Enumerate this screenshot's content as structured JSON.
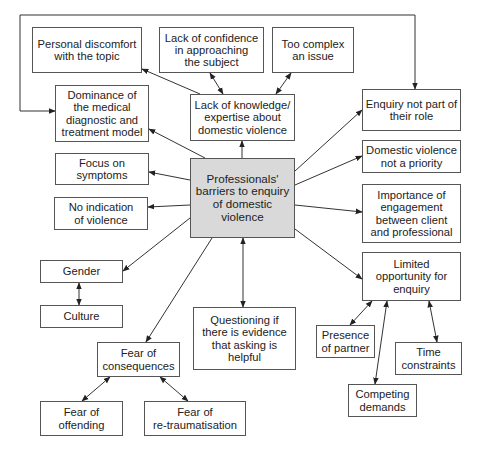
{
  "diagram": {
    "title": "Professionals' barriers to enquiry of domestic violence",
    "colors": {
      "line": "#333333",
      "border": "#555555",
      "central_fill": "#d9d9d9",
      "text": "#222222"
    },
    "nodes": [
      {
        "id": "central",
        "label": "Professionals'\nbarriers to enquiry\nof domestic\nviolence",
        "x": 190,
        "y": 158,
        "w": 105,
        "h": 80,
        "central": true
      },
      {
        "id": "personal_discomfort",
        "label": "Personal discomfort\nwith the topic",
        "x": 32,
        "y": 27,
        "w": 110,
        "h": 46
      },
      {
        "id": "lack_confidence",
        "label": "Lack of confidence\nin approaching\nthe subject",
        "x": 159,
        "y": 27,
        "w": 105,
        "h": 46
      },
      {
        "id": "too_complex",
        "label": "Too complex\nan issue",
        "x": 272,
        "y": 27,
        "w": 82,
        "h": 46
      },
      {
        "id": "dominance",
        "label": "Dominance of\nthe medical\ndiagnostic and\ntreatment model",
        "x": 55,
        "y": 85,
        "w": 94,
        "h": 57
      },
      {
        "id": "lack_knowledge",
        "label": "Lack of knowledge/\nexpertise about\ndomestic violence",
        "x": 190,
        "y": 94,
        "w": 105,
        "h": 47
      },
      {
        "id": "enquiry_not_role",
        "label": "Enquiry not part of\ntheir role",
        "x": 362,
        "y": 89,
        "w": 99,
        "h": 42
      },
      {
        "id": "focus_symptoms",
        "label": "Focus on\nsymptoms",
        "x": 55,
        "y": 153,
        "w": 94,
        "h": 32
      },
      {
        "id": "dv_not_priority",
        "label": "Domestic violence\nnot a priority",
        "x": 362,
        "y": 140,
        "w": 99,
        "h": 33
      },
      {
        "id": "no_indication",
        "label": "No indication\nof violence",
        "x": 54,
        "y": 197,
        "w": 94,
        "h": 33
      },
      {
        "id": "importance_engagement",
        "label": "Importance of\nengagement\nbetween client\nand professional",
        "x": 362,
        "y": 184,
        "w": 99,
        "h": 59
      },
      {
        "id": "gender",
        "label": "Gender",
        "x": 40,
        "y": 260,
        "w": 83,
        "h": 23
      },
      {
        "id": "culture",
        "label": "Culture",
        "x": 40,
        "y": 305,
        "w": 83,
        "h": 23
      },
      {
        "id": "limited_opportunity",
        "label": "Limited\nopportunity for\nenquiry",
        "x": 362,
        "y": 252,
        "w": 99,
        "h": 49
      },
      {
        "id": "questioning_evidence",
        "label": "Questioning if\nthere is evidence\nthat asking is\nhelpful",
        "x": 193,
        "y": 307,
        "w": 103,
        "h": 63
      },
      {
        "id": "presence_partner",
        "label": "Presence\nof partner",
        "x": 316,
        "y": 325,
        "w": 59,
        "h": 33
      },
      {
        "id": "time_constraints",
        "label": "Time\nconstraints",
        "x": 395,
        "y": 342,
        "w": 67,
        "h": 33
      },
      {
        "id": "fear_consequences",
        "label": "Fear of\nconsequences",
        "x": 97,
        "y": 342,
        "w": 83,
        "h": 35
      },
      {
        "id": "competing_demands",
        "label": "Competing\ndemands",
        "x": 348,
        "y": 384,
        "w": 69,
        "h": 33
      },
      {
        "id": "fear_offending",
        "label": "Fear of\noffending",
        "x": 40,
        "y": 401,
        "w": 83,
        "h": 35
      },
      {
        "id": "fear_retraumatisation",
        "label": "Fear of\nre-traumatisation",
        "x": 144,
        "y": 401,
        "w": 102,
        "h": 35
      }
    ],
    "edges": [
      {
        "from": "central",
        "to": "lack_knowledge",
        "type": "arrow",
        "points": [
          [
            242,
            158
          ],
          [
            242,
            141
          ]
        ]
      },
      {
        "from": "central",
        "to": "dominance",
        "type": "arrow",
        "points": [
          [
            205,
            158
          ],
          [
            149,
            129
          ]
        ]
      },
      {
        "from": "central",
        "to": "focus_symptoms",
        "type": "arrow",
        "points": [
          [
            190,
            180
          ],
          [
            149,
            172
          ]
        ]
      },
      {
        "from": "central",
        "to": "no_indication",
        "type": "arrow",
        "points": [
          [
            190,
            205
          ],
          [
            148,
            207
          ]
        ]
      },
      {
        "from": "central",
        "to": "gender",
        "type": "arrow",
        "points": [
          [
            190,
            218
          ],
          [
            123,
            271
          ]
        ]
      },
      {
        "from": "central",
        "to": "fear_consequences",
        "type": "arrow",
        "points": [
          [
            212,
            238
          ],
          [
            146,
            342
          ]
        ]
      },
      {
        "from": "central",
        "to": "questioning_evidence",
        "type": "double",
        "points": [
          [
            243,
            238
          ],
          [
            243,
            307
          ]
        ]
      },
      {
        "from": "central",
        "to": "enquiry_not_role",
        "type": "arrow",
        "points": [
          [
            295,
            171
          ],
          [
            362,
            110
          ]
        ]
      },
      {
        "from": "central",
        "to": "dv_not_priority",
        "type": "arrow",
        "points": [
          [
            295,
            185
          ],
          [
            362,
            156
          ]
        ]
      },
      {
        "from": "central",
        "to": "importance_engagement",
        "type": "arrow",
        "points": [
          [
            295,
            205
          ],
          [
            362,
            212
          ]
        ]
      },
      {
        "from": "central",
        "to": "limited_opportunity",
        "type": "arrow",
        "points": [
          [
            295,
            229
          ],
          [
            362,
            279
          ]
        ]
      },
      {
        "from": "lack_knowledge",
        "to": "personal_discomfort",
        "type": "arrow",
        "points": [
          [
            200,
            94
          ],
          [
            142,
            69
          ]
        ]
      },
      {
        "from": "lack_knowledge",
        "to": "lack_confidence",
        "type": "double",
        "points": [
          [
            223,
            94
          ],
          [
            210,
            73
          ]
        ]
      },
      {
        "from": "lack_knowledge",
        "to": "too_complex",
        "type": "double",
        "points": [
          [
            276,
            94
          ],
          [
            291,
            73
          ]
        ]
      },
      {
        "from": "gender",
        "to": "culture",
        "type": "double",
        "points": [
          [
            79,
            283
          ],
          [
            79,
            305
          ]
        ]
      },
      {
        "from": "fear_consequences",
        "to": "fear_offending",
        "type": "double",
        "points": [
          [
            110,
            377
          ],
          [
            82,
            401
          ]
        ]
      },
      {
        "from": "fear_consequences",
        "to": "fear_retraumatisation",
        "type": "double",
        "points": [
          [
            160,
            377
          ],
          [
            188,
            401
          ]
        ]
      },
      {
        "from": "limited_opportunity",
        "to": "presence_partner",
        "type": "double",
        "points": [
          [
            372,
            301
          ],
          [
            350,
            325
          ]
        ]
      },
      {
        "from": "limited_opportunity",
        "to": "competing_demands",
        "type": "double",
        "points": [
          [
            387,
            301
          ],
          [
            375,
            384
          ]
        ]
      },
      {
        "from": "limited_opportunity",
        "to": "time_constraints",
        "type": "double",
        "points": [
          [
            429,
            301
          ],
          [
            437,
            342
          ]
        ]
      },
      {
        "from": "outer_loop",
        "to": "dominance",
        "type": "arrow",
        "points": [
          [
            258,
            15
          ],
          [
            20,
            15
          ],
          [
            20,
            111
          ],
          [
            55,
            111
          ]
        ]
      },
      {
        "from": "outer_loop",
        "to": "enquiry_not_role",
        "type": "arrow",
        "points": [
          [
            258,
            15
          ],
          [
            415,
            15
          ],
          [
            415,
            89
          ]
        ]
      }
    ]
  }
}
